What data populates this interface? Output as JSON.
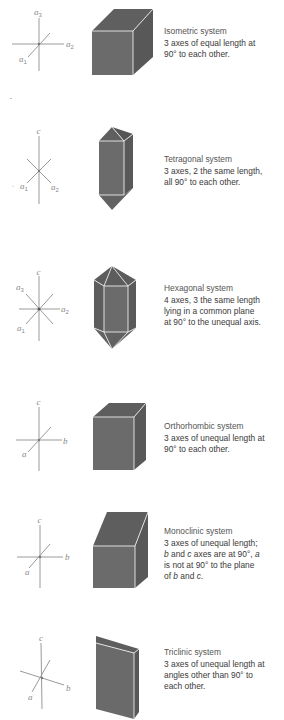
{
  "figure": {
    "colors": {
      "background": "#ffffff",
      "crystal_front": "#6b6b6b",
      "crystal_top": "#5d5d5d",
      "crystal_side": "#595959",
      "crystal_edge": "#ececec",
      "axis_line": "#9a9a9a",
      "axis_label": "#8a8a8a",
      "text": "#3a3a3a"
    },
    "systems": [
      {
        "name": "Isometric system",
        "axes_labels": [
          "a3",
          "a2",
          "a1"
        ],
        "axes": {
          "top": "a",
          "top_sub": "3",
          "right": "a",
          "right_sub": "2",
          "left": "a",
          "left_sub": "1"
        },
        "shape": "cube",
        "description": [
          "3 axes of equal length at",
          "90° to each other."
        ]
      },
      {
        "name": "Tetragonal system",
        "axes": {
          "top": "c",
          "left": "a",
          "left_sub": "1",
          "right": "a",
          "right_sub": "2"
        },
        "shape": "tetragonal-prism",
        "description": [
          "3 axes, 2 the same length,",
          "all 90° to each other."
        ]
      },
      {
        "name": "Hexagonal system",
        "axes": {
          "top": "c",
          "upper_left": "a",
          "upper_left_sub": "3",
          "right": "a",
          "right_sub": "2",
          "left": "a",
          "left_sub": "1"
        },
        "shape": "hexagonal-bipyramid-prism",
        "description": [
          "4 axes, 3 the same length",
          "lying in a common plane",
          "at 90° to the unequal axis."
        ]
      },
      {
        "name": "Orthorhombic system",
        "axes": {
          "top": "c",
          "right": "b",
          "left": "a"
        },
        "shape": "rectangular-prism",
        "description": [
          "3 axes of unequal length at",
          "90° to each other."
        ]
      },
      {
        "name": "Monoclinic system",
        "axes": {
          "top": "c",
          "right": "b",
          "left": "a"
        },
        "shape": "monoclinic-prism",
        "description_parts": [
          [
            {
              "t": "3 axes of unequal length;",
              "i": false
            }
          ],
          [
            {
              "t": "b",
              "i": true
            },
            {
              "t": " and ",
              "i": false
            },
            {
              "t": "c",
              "i": true
            },
            {
              "t": " axes are at 90°, ",
              "i": false
            },
            {
              "t": "a",
              "i": true
            }
          ],
          [
            {
              "t": "is not at 90° to the plane",
              "i": false
            }
          ],
          [
            {
              "t": "of ",
              "i": false
            },
            {
              "t": "b",
              "i": true
            },
            {
              "t": " and ",
              "i": false
            },
            {
              "t": "c",
              "i": true
            },
            {
              "t": ".",
              "i": false
            }
          ]
        ],
        "description": [
          "3 axes of unequal length;",
          "b and c axes are at 90°, a",
          "is not at 90° to the plane",
          "of b and c."
        ]
      },
      {
        "name": "Triclinic system",
        "axes": {
          "top": "c",
          "right": "b",
          "left": "a"
        },
        "shape": "triclinic-prism",
        "description": [
          "3 axes of unequal length at",
          "angles other than 90° to",
          "each other."
        ]
      }
    ]
  }
}
